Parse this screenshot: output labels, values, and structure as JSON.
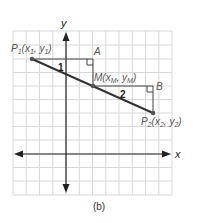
{
  "figure": {
    "caption": "(b)",
    "axes": {
      "x_label": "x",
      "y_label": "y"
    },
    "points": {
      "P1": {
        "name": "P",
        "sub": "1",
        "coords": "(x",
        "coords_sub1": "1",
        "sep": ", y",
        "coords_sub2": "1",
        "close": ")"
      },
      "M": {
        "name": "M",
        "coords": "(x",
        "coords_sub1": "M",
        "sep": ", y",
        "coords_sub2": "M",
        "close": ")"
      },
      "P2": {
        "name": "P",
        "sub": "2",
        "coords": "(x",
        "coords_sub1": "2",
        "sep": ", y",
        "coords_sub2": "2",
        "close": ")"
      },
      "A": {
        "name": "A"
      },
      "B": {
        "name": "B"
      }
    },
    "triangle_labels": {
      "t1": "1",
      "t2": "2"
    },
    "colors": {
      "grid": "#d8d8d8",
      "axis": "#222222",
      "segment": "#333333",
      "label": "#555555"
    }
  }
}
